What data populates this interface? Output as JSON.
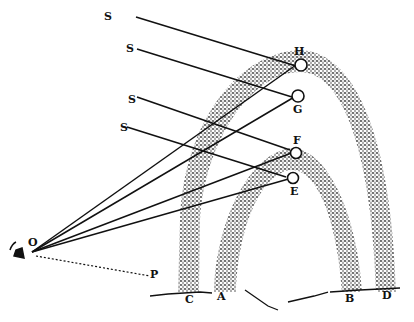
{
  "figure": {
    "colors": {
      "ink": "#111111",
      "background": "#ffffff",
      "stipple": "#333333"
    },
    "sun_ray_labels": [
      "S",
      "S",
      "S",
      "S"
    ],
    "drop_labels": {
      "H": "H",
      "G": "G",
      "F": "F",
      "E": "E"
    },
    "observer_label": "O",
    "horizon_point_label": "P",
    "ground_labels": {
      "C": "C",
      "A": "A",
      "B": "B",
      "D": "D"
    },
    "arcs": [
      {
        "name": "outer-bow",
        "feet": [
          "C",
          "D"
        ]
      },
      {
        "name": "inner-bow",
        "feet": [
          "A",
          "B"
        ]
      }
    ]
  }
}
